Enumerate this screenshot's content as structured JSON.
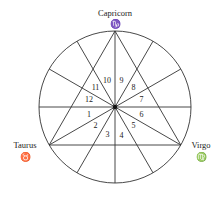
{
  "diagram": {
    "type": "astrological-chart",
    "colors": {
      "line": "#333333",
      "text": "#222222",
      "background": "#ffffff"
    },
    "signs": [
      {
        "name": "Capricorn",
        "glyph": "♑",
        "position": "top"
      },
      {
        "name": "Taurus",
        "glyph": "♉",
        "position": "bottom-left"
      },
      {
        "name": "Virgo",
        "glyph": "♍",
        "position": "bottom-right"
      }
    ],
    "houses": [
      "1",
      "2",
      "3",
      "4",
      "5",
      "6",
      "7",
      "8",
      "9",
      "10",
      "11",
      "12"
    ]
  }
}
